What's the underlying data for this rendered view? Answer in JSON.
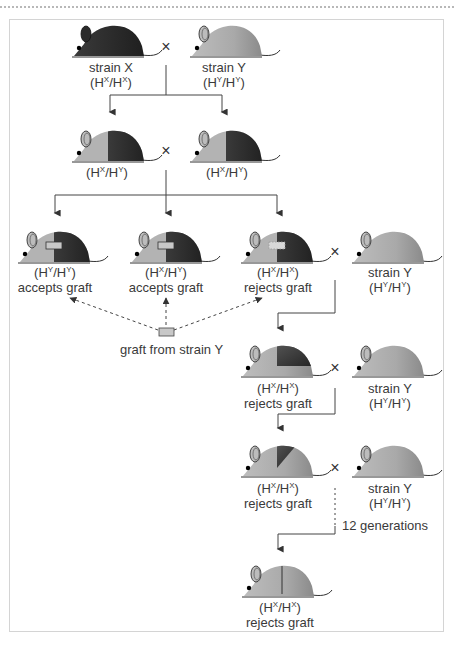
{
  "cross_symbol": "×",
  "colors": {
    "strain_x": "#2b2b2b",
    "strain_y": "#a8a8a8",
    "strain_y_light": "#c4c4c4",
    "graft": "#c8c8c8",
    "line": "#444444",
    "frame": "#d4d4d4"
  },
  "generations": [
    {
      "name": "parental",
      "mice": [
        {
          "id": "p-x",
          "label": "strain X",
          "genotype": "(H^X/H^X)",
          "g1": "X",
          "g2": "X",
          "pattern": "dark"
        },
        {
          "id": "p-y",
          "label": "strain Y",
          "genotype": "(H^Y/H^Y)",
          "g1": "Y",
          "g2": "Y",
          "pattern": "light"
        }
      ]
    },
    {
      "name": "F1",
      "mice": [
        {
          "id": "f1-a",
          "genotype": "(H^X/H^Y)",
          "g1": "X",
          "g2": "Y",
          "pattern": "half"
        },
        {
          "id": "f1-b",
          "genotype": "(H^X/H^Y)",
          "g1": "X",
          "g2": "Y",
          "pattern": "half"
        }
      ]
    },
    {
      "name": "F2",
      "mice": [
        {
          "id": "f2-a",
          "genotype": "(H^Y/H^Y)",
          "g1": "Y",
          "g2": "Y",
          "result": "accepts graft",
          "pattern": "half-graft"
        },
        {
          "id": "f2-b",
          "genotype": "(H^X/H^Y)",
          "g1": "X",
          "g2": "Y",
          "result": "accepts graft",
          "pattern": "half-graft"
        },
        {
          "id": "f2-c",
          "genotype": "(H^X/H^X)",
          "g1": "X",
          "g2": "X",
          "result": "rejects graft",
          "pattern": "half-graft-rejected"
        },
        {
          "id": "f2-y",
          "label": "strain Y",
          "genotype": "(H^Y/H^Y)",
          "g1": "Y",
          "g2": "Y",
          "pattern": "light"
        }
      ]
    },
    {
      "name": "backcross-1",
      "mice": [
        {
          "id": "b1",
          "genotype": "(H^X/H^X)",
          "g1": "X",
          "g2": "X",
          "result": "rejects graft",
          "pattern": "quarter"
        },
        {
          "id": "b1-y",
          "label": "strain Y",
          "genotype": "(H^Y/H^Y)",
          "g1": "Y",
          "g2": "Y",
          "pattern": "light"
        }
      ]
    },
    {
      "name": "backcross-2",
      "mice": [
        {
          "id": "b2",
          "genotype": "(H^X/H^X)",
          "g1": "X",
          "g2": "X",
          "result": "rejects graft",
          "pattern": "eighth"
        },
        {
          "id": "b2-y",
          "label": "strain Y",
          "genotype": "(H^Y/H^Y)",
          "g1": "Y",
          "g2": "Y",
          "pattern": "light"
        }
      ]
    },
    {
      "name": "congenic",
      "mice": [
        {
          "id": "c",
          "genotype": "(H^X/H^X)",
          "g1": "X",
          "g2": "X",
          "result": "rejects graft",
          "pattern": "line"
        }
      ]
    }
  ],
  "graft_source_label": "graft from strain Y",
  "generations_note": "12 generations",
  "text": {
    "strain_x": "strain X",
    "strain_y": "strain Y",
    "accepts": "accepts graft",
    "rejects": "rejects graft",
    "H": "H",
    "X": "X",
    "Y": "Y"
  }
}
